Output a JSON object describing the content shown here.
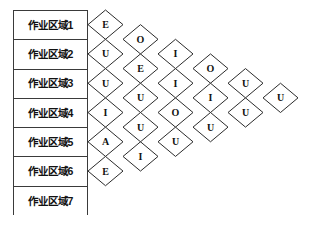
{
  "diagram": {
    "type": "activity-relationship-chart",
    "areas": [
      {
        "label": "作业区域1"
      },
      {
        "label": "作业区域2"
      },
      {
        "label": "作业区域3"
      },
      {
        "label": "作业区域4"
      },
      {
        "label": "作业区域5"
      },
      {
        "label": "作业区域6"
      },
      {
        "label": "作业区域7"
      }
    ],
    "relationship_columns": [
      {
        "pair_base": 1,
        "ratings": [
          "E",
          "U",
          "U",
          "I",
          "A",
          "E"
        ]
      },
      {
        "pair_base": 2,
        "ratings": [
          "O",
          "E",
          "U",
          "U",
          "I"
        ]
      },
      {
        "pair_base": 3,
        "ratings": [
          "I",
          "I",
          "O",
          "U"
        ]
      },
      {
        "pair_base": 4,
        "ratings": [
          "O",
          "I",
          "U"
        ]
      },
      {
        "pair_base": 5,
        "ratings": [
          "U",
          "U"
        ]
      },
      {
        "pair_base": 6,
        "ratings": [
          "U"
        ]
      }
    ],
    "colors": {
      "line": "#2b2b2b",
      "box_border": "#3a3a3a",
      "text": "#111111",
      "background": "#ffffff"
    }
  },
  "geometry": {
    "grid_origin_x": 88,
    "grid_origin_y": 10,
    "cell_w": 35.0,
    "cell_h": 29.285714
  }
}
